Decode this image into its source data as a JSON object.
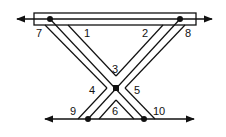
{
  "diagram": {
    "type": "geometry-figure",
    "colors": {
      "stroke": "#111111",
      "background": "#ffffff"
    },
    "labels": [
      {
        "id": "7",
        "text": "7",
        "x": 36,
        "y": 37
      },
      {
        "id": "1",
        "text": "1",
        "x": 84,
        "y": 37
      },
      {
        "id": "2",
        "text": "2",
        "x": 142,
        "y": 37
      },
      {
        "id": "8",
        "text": "8",
        "x": 185,
        "y": 37
      },
      {
        "id": "3",
        "text": "3",
        "x": 112,
        "y": 73
      },
      {
        "id": "4",
        "text": "4",
        "x": 89,
        "y": 94
      },
      {
        "id": "5",
        "text": "5",
        "x": 134,
        "y": 94
      },
      {
        "id": "9",
        "text": "9",
        "x": 70,
        "y": 115
      },
      {
        "id": "6",
        "text": "6",
        "x": 112,
        "y": 115
      },
      {
        "id": "10",
        "text": "10",
        "x": 153,
        "y": 115
      }
    ],
    "points": [
      {
        "name": "top-left-point",
        "x": 50,
        "y": 19
      },
      {
        "name": "top-right-point",
        "x": 180,
        "y": 19
      },
      {
        "name": "center-intersection-point",
        "x": 116,
        "y": 88
      },
      {
        "name": "bottom-left-point",
        "x": 88,
        "y": 119
      },
      {
        "name": "bottom-right-point",
        "x": 144,
        "y": 119
      }
    ]
  }
}
